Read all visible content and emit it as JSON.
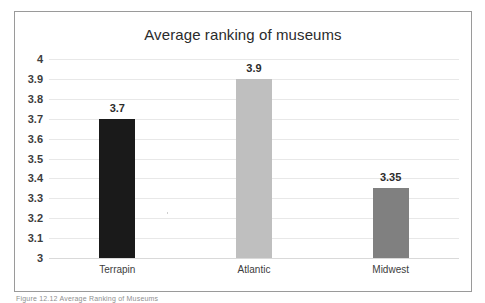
{
  "figure": {
    "caption": "Figure 12.12  Average Ranking of Museums"
  },
  "chart_data": {
    "type": "bar",
    "title": "Average ranking of museums",
    "xlabel": "",
    "ylabel": "",
    "categories": [
      "Terrapin",
      "Atlantic",
      "Midwest"
    ],
    "values": [
      3.7,
      3.9,
      3.35
    ],
    "value_labels": [
      "3.7",
      "3.9",
      "3.35"
    ],
    "bar_colors": [
      "#1a1a1a",
      "#bfbfbf",
      "#808080"
    ],
    "ylim": [
      3,
      4
    ],
    "ytick_values": [
      4,
      3.9,
      3.8,
      3.7,
      3.6,
      3.5,
      3.4,
      3.3,
      3.2,
      3.1,
      3
    ],
    "ytick_labels": [
      "4",
      "3.9",
      "3.8",
      "3.7",
      "3.6",
      "3.5",
      "3.4",
      "3.3",
      "3.2",
      "3.1",
      "3"
    ],
    "grid": true,
    "legend": false,
    "legend_position": "none",
    "frame_color": "#9a9a9a",
    "gridline_color": "#e8e8e8",
    "title_color": "#2b2b2b",
    "tick_label_color": "#3d3d3d"
  }
}
